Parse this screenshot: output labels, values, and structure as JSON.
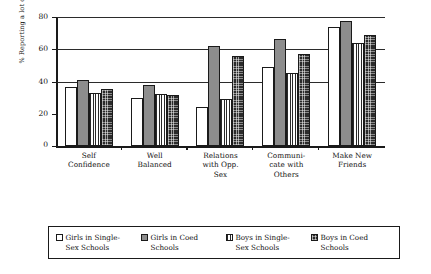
{
  "chart_data": {
    "type": "bar",
    "title": "",
    "xlabel": "",
    "ylabel": "% Reporting a lot of Benefit",
    "ylim": [
      0,
      80
    ],
    "yticks": [
      0,
      20,
      40,
      60,
      80
    ],
    "grid": "horizontal gridlines at 20, 40, 60, 80",
    "legend_position": "bottom, bordered box, 4 entries in one row",
    "categories": [
      "Self\nConfidence",
      "Well\nBalanced",
      "Relations\nwith Opp.\nSex",
      "Communi-\ncate with\nOthers",
      "Make New\nFriends"
    ],
    "series": [
      {
        "name": "Girls in Single-\nSex Schools",
        "pattern": "white",
        "values": [
          36.5,
          30,
          24,
          49,
          74
        ]
      },
      {
        "name": "Girls in Coed\nSchools",
        "pattern": "solid-gray",
        "values": [
          41,
          38,
          62,
          66.5,
          77.5
        ]
      },
      {
        "name": "Boys in Single-\nSex Schools",
        "pattern": "vertical-stripes",
        "values": [
          33,
          32,
          29,
          45.5,
          64
        ]
      },
      {
        "name": "Boys in Coed\nSchools",
        "pattern": "dark-dotted",
        "values": [
          35.5,
          31.5,
          56,
          57,
          69
        ]
      }
    ]
  },
  "axis": {
    "y_title": "% Reporting a lot of Benefit",
    "tick_labels": [
      "80",
      "60",
      "40",
      "20",
      "0"
    ]
  },
  "categories": [
    {
      "lines": [
        "Self",
        "Confidence"
      ]
    },
    {
      "lines": [
        "Well",
        "Balanced"
      ]
    },
    {
      "lines": [
        "Relations",
        "with Opp.",
        "Sex"
      ]
    },
    {
      "lines": [
        "Communi-",
        "cate with",
        "Others"
      ]
    },
    {
      "lines": [
        "Make New",
        "Friends"
      ]
    }
  ],
  "legend": {
    "items": [
      {
        "label": "Girls in Single-\nSex Schools",
        "swatch": "white-swatch"
      },
      {
        "label": "Girls in Coed\nSchools",
        "swatch": "gray-swatch"
      },
      {
        "label": "Boys in Single-\nSex Schools",
        "swatch": "striped-swatch"
      },
      {
        "label": "Boys in Coed\nSchools",
        "swatch": "dark-dotted-swatch"
      }
    ]
  },
  "colors": {
    "axis": "#1a1a1a",
    "gray_bar": "#8d8d8d",
    "dark_bar": "#2b2b2b",
    "background": "#ffffff"
  }
}
